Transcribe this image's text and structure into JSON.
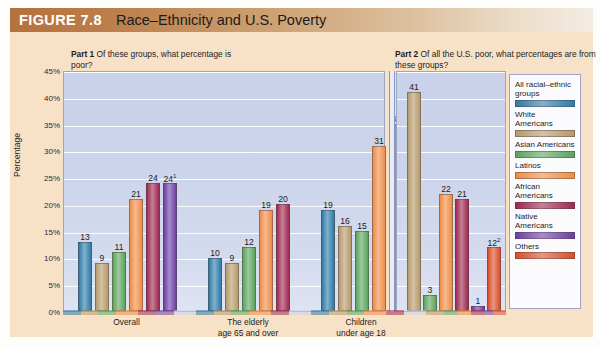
{
  "figure": {
    "number_label": "FIGURE 7.8",
    "title": "Race–Ethnicity and U.S. Poverty"
  },
  "part1": {
    "caption_bold": "Part 1",
    "caption_text": " Of these groups, what percentage is poor?"
  },
  "part2": {
    "caption_bold": "Part 2",
    "caption_text": " Of all the U.S. poor, what percentages are from these groups?"
  },
  "legend": {
    "items": [
      {
        "label": "All racial–ethnic groups",
        "color": "#2f7ba8"
      },
      {
        "label": "White Americans",
        "color": "#b59a6a"
      },
      {
        "label": "Asian Americans",
        "color": "#5aa55d"
      },
      {
        "label": "Latinos",
        "color": "#ef8c46"
      },
      {
        "label": "African Americans",
        "color": "#9e2a52"
      },
      {
        "label": "Native Americans",
        "color": "#6d3fa5"
      },
      {
        "label": "Others",
        "color": "#d94f2a"
      }
    ]
  },
  "chart_data": {
    "type": "bar",
    "title": "Race–Ethnicity and U.S. Poverty",
    "ylabel": "Percentage",
    "xlabel": "",
    "ylim": [
      0,
      45
    ],
    "ytick_labels": [
      "0%",
      "5%",
      "10%",
      "15%",
      "20%",
      "25%",
      "30%",
      "35%",
      "40%",
      "45%"
    ],
    "ytick_values": [
      0,
      5,
      10,
      15,
      20,
      25,
      30,
      35,
      40,
      45
    ],
    "grid": true,
    "legend_position": "right",
    "panels": [
      {
        "name": "Part 1",
        "question": "Of these groups, what percentage is poor?",
        "categories": [
          "Overall",
          "The elderly\nage 65 and over",
          "Children\nunder age 18"
        ],
        "category_labels": [
          {
            "line1": "Overall",
            "line2": ""
          },
          {
            "line1": "The elderly",
            "line2": "age 65 and over"
          },
          {
            "line1": "Children",
            "line2": "under age 18"
          }
        ],
        "groups": [
          {
            "category": "Overall",
            "bars": [
              {
                "series": "All racial–ethnic groups",
                "value": 13,
                "label": "13",
                "color": "#2f7ba8"
              },
              {
                "series": "White Americans",
                "value": 9,
                "label": "9",
                "color": "#b59a6a"
              },
              {
                "series": "Asian Americans",
                "value": 11,
                "label": "11",
                "color": "#5aa55d"
              },
              {
                "series": "Latinos",
                "value": 21,
                "label": "21",
                "color": "#ef8c46"
              },
              {
                "series": "African Americans",
                "value": 24,
                "label": "24",
                "color": "#9e2a52"
              },
              {
                "series": "Native Americans",
                "value": 24,
                "label": "24",
                "footnote": "1",
                "color": "#6d3fa5"
              }
            ]
          },
          {
            "category": "The elderly age 65 and over",
            "bars": [
              {
                "series": "All racial–ethnic groups",
                "value": 10,
                "label": "10",
                "color": "#2f7ba8"
              },
              {
                "series": "White Americans",
                "value": 9,
                "label": "9",
                "color": "#b59a6a"
              },
              {
                "series": "Asian Americans",
                "value": 12,
                "label": "12",
                "color": "#5aa55d"
              },
              {
                "series": "Latinos",
                "value": 19,
                "label": "19",
                "color": "#ef8c46"
              },
              {
                "series": "African Americans",
                "value": 20,
                "label": "20",
                "color": "#9e2a52"
              }
            ]
          },
          {
            "category": "Children under age 18",
            "bars": [
              {
                "series": "All racial–ethnic groups",
                "value": 19,
                "label": "19",
                "color": "#2f7ba8"
              },
              {
                "series": "White Americans",
                "value": 16,
                "label": "16",
                "color": "#b59a6a"
              },
              {
                "series": "Asian Americans",
                "value": 15,
                "label": "15",
                "color": "#5aa55d"
              },
              {
                "series": "Latinos",
                "value": 31,
                "label": "31",
                "color": "#ef8c46"
              },
              {
                "series": "African Americans",
                "value": 35,
                "label": "35",
                "color": "#9e2a52"
              }
            ]
          }
        ]
      },
      {
        "name": "Part 2",
        "question": "Of all the U.S. poor, what percentages are from these groups?",
        "categories": [
          ""
        ],
        "groups": [
          {
            "category": "",
            "bars": [
              {
                "series": "White Americans",
                "value": 41,
                "label": "41",
                "color": "#b59a6a"
              },
              {
                "series": "Asian Americans",
                "value": 3,
                "label": "3",
                "color": "#5aa55d"
              },
              {
                "series": "Latinos",
                "value": 22,
                "label": "22",
                "color": "#ef8c46"
              },
              {
                "series": "African Americans",
                "value": 21,
                "label": "21",
                "color": "#9e2a52"
              },
              {
                "series": "Native Americans",
                "value": 1,
                "label": "1",
                "color": "#6d3fa5"
              },
              {
                "series": "Others",
                "value": 12,
                "label": "12",
                "footnote": "2",
                "color": "#d94f2a"
              }
            ]
          }
        ]
      }
    ]
  }
}
